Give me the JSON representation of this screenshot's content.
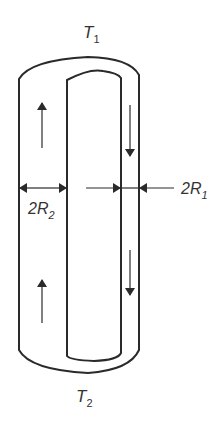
{
  "diagram": {
    "top_label": {
      "main": "T",
      "sub": "1"
    },
    "bottom_label": {
      "main": "T",
      "sub": "2"
    },
    "left_dim_label": {
      "prefix": "2",
      "main": "R",
      "sub": "2"
    },
    "right_dim_label": {
      "prefix": "2",
      "main": "R",
      "sub": "1"
    },
    "flow": {
      "left_channel": "up",
      "right_channel": "down"
    },
    "colors": {
      "stroke": "#2a2a2a",
      "background": "#ffffff"
    }
  }
}
